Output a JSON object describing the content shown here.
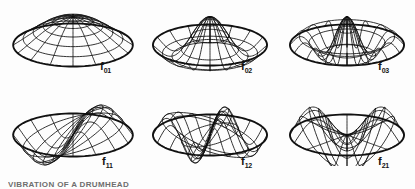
{
  "figure": {
    "background_color": "#fdfdfd",
    "line_color": "#111111",
    "caption": "VIBRATION OF A DRUMHEAD",
    "rows": 2,
    "columns": 3
  },
  "panels": [
    {
      "id": "f01",
      "label_base": "f",
      "label_sub": "01",
      "nodal_diameters": 0,
      "nodal_circles": 1,
      "shape": "dome",
      "x": 8,
      "y": 6,
      "width": 130,
      "height": 70,
      "label_x": 100,
      "label_y": 61
    },
    {
      "id": "f02",
      "label_base": "f",
      "label_sub": "02",
      "nodal_diameters": 0,
      "nodal_circles": 2,
      "shape": "one-ring",
      "x": 148,
      "y": 6,
      "width": 124,
      "height": 70,
      "label_x": 241,
      "label_y": 61
    },
    {
      "id": "f03",
      "label_base": "f",
      "label_sub": "03",
      "nodal_diameters": 0,
      "nodal_circles": 3,
      "shape": "two-ring",
      "x": 285,
      "y": 6,
      "width": 124,
      "height": 70,
      "label_x": 378,
      "label_y": 61
    },
    {
      "id": "f11",
      "label_base": "f",
      "label_sub": "11",
      "nodal_diameters": 1,
      "nodal_circles": 1,
      "shape": "saddle",
      "x": 8,
      "y": 96,
      "width": 130,
      "height": 70,
      "label_x": 102,
      "label_y": 156
    },
    {
      "id": "f12",
      "label_base": "f",
      "label_sub": "12",
      "nodal_diameters": 1,
      "nodal_circles": 2,
      "shape": "saddle-ring",
      "x": 148,
      "y": 96,
      "width": 124,
      "height": 70,
      "label_x": 241,
      "label_y": 156
    },
    {
      "id": "f21",
      "label_base": "f",
      "label_sub": "21",
      "nodal_diameters": 2,
      "nodal_circles": 1,
      "shape": "quadrupole",
      "x": 285,
      "y": 96,
      "width": 124,
      "height": 70,
      "label_x": 378,
      "label_y": 156
    }
  ],
  "chart_data": {
    "type": "surface-grid",
    "projection": {
      "type": "isometric",
      "elevation_scale": 0.36,
      "vertical_exaggeration": 1.0
    },
    "mesh": {
      "radial_spokes": 16,
      "concentric_rings": 6
    },
    "series": [
      {
        "name": "f01",
        "m": 0,
        "n": 1,
        "bessel_root": 2.405,
        "nodal_diameters": 0,
        "nodal_circles": 1,
        "peak_amplitude": 1.0,
        "peak_location": "center"
      },
      {
        "name": "f02",
        "m": 0,
        "n": 2,
        "bessel_root": 5.52,
        "nodal_diameters": 0,
        "nodal_circles": 2,
        "peak_amplitude": 1.0,
        "peak_location": "center"
      },
      {
        "name": "f03",
        "m": 0,
        "n": 3,
        "bessel_root": 8.654,
        "nodal_diameters": 0,
        "nodal_circles": 3,
        "peak_amplitude": 1.0,
        "peak_location": "center"
      },
      {
        "name": "f11",
        "m": 1,
        "n": 1,
        "bessel_root": 3.832,
        "nodal_diameters": 1,
        "nodal_circles": 1,
        "peak_amplitude": 1.0,
        "peak_location": "off-center"
      },
      {
        "name": "f12",
        "m": 1,
        "n": 2,
        "bessel_root": 7.016,
        "nodal_diameters": 1,
        "nodal_circles": 2,
        "peak_amplitude": 1.0,
        "peak_location": "off-center"
      },
      {
        "name": "f21",
        "m": 2,
        "n": 1,
        "bessel_root": 5.136,
        "nodal_diameters": 2,
        "nodal_circles": 1,
        "peak_amplitude": 1.0,
        "peak_location": "off-center"
      }
    ],
    "xlabel": "",
    "ylabel": "",
    "legend": "none",
    "grid": true
  }
}
